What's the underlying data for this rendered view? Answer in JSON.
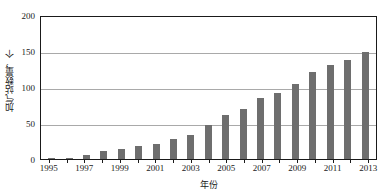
{
  "chart_data": {
    "type": "bar",
    "title": "",
    "subtitle": "",
    "xlabel": "年份",
    "ylabel": "加气站数量，个",
    "categories": [
      "1995",
      "1996",
      "1997",
      "1998",
      "1999",
      "2000",
      "2001",
      "2002",
      "2003",
      "2004",
      "2005",
      "2006",
      "2007",
      "2008",
      "2009",
      "2010",
      "2011",
      "2012",
      "2013"
    ],
    "values": [
      1,
      2,
      6,
      11,
      14,
      18,
      21,
      28,
      34,
      47,
      61,
      69,
      85,
      92,
      104,
      121,
      131,
      137,
      148
    ],
    "ylim": [
      0,
      200
    ],
    "yticks": [
      0,
      50,
      100,
      150,
      200
    ],
    "ytick_labels": [
      "0",
      "50",
      "100",
      "150",
      "200"
    ],
    "xtick_labels": [
      "1995",
      "1997",
      "1999",
      "2001",
      "2003",
      "2005",
      "2007",
      "2009",
      "2011",
      "2013"
    ],
    "xtick_categories": [
      "1995",
      "1997",
      "1999",
      "2001",
      "2003",
      "2005",
      "2007",
      "2009",
      "2011",
      "2013"
    ],
    "grid": "horizontal",
    "legend": "none",
    "bar_color": "#6e6e6e",
    "gridline_color": "#a9a9a9",
    "axis_color": "#1a1a1a",
    "background_color": "#ffffff"
  }
}
